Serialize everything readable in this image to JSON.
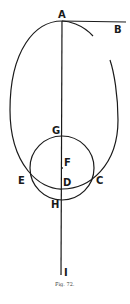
{
  "figure": {
    "caption": "Fig. 72.",
    "stroke_color": "#1a1a1a",
    "points": {
      "A": "A",
      "B": "B",
      "G": "G",
      "F": "F",
      "E": "E",
      "D": "D",
      "C": "C",
      "H": "H",
      "I": "I"
    },
    "elements": [
      {
        "type": "oval",
        "description": "large egg-shaped curve with top at A and bottom at D, open gap at upper right"
      },
      {
        "type": "circle",
        "description": "circle centered at F passing through G, E, C, H"
      },
      {
        "type": "line",
        "description": "vertical axis from A through G, F, D, H to I"
      },
      {
        "type": "line",
        "description": "horizontal tangent from A to B"
      }
    ]
  }
}
